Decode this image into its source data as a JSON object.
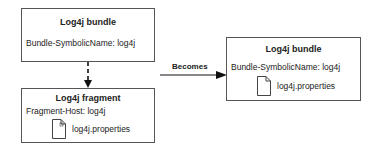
{
  "diagram": {
    "source_bundle": {
      "title": "Log4j bundle",
      "attribute": "Bundle-SymbolicName: log4j"
    },
    "fragment": {
      "title": "Log4j fragment",
      "attribute": "Fragment-Host: log4j",
      "file": "log4j.properties",
      "file_icon": "document-icon"
    },
    "result_bundle": {
      "title": "Log4j bundle",
      "attribute": "Bundle-SymbolicName: log4j",
      "file": "log4j.properties",
      "file_icon": "document-icon"
    },
    "transition_label": "Becomes",
    "colors": {
      "border": "#555555",
      "text": "#222222",
      "arrow": "#111111"
    }
  }
}
